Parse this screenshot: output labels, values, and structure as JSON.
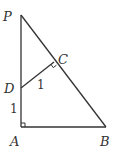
{
  "diagram": {
    "type": "geometry",
    "points": {
      "P": {
        "label": "P",
        "x": 21,
        "y": 15,
        "lx": 3,
        "ly": 21
      },
      "A": {
        "label": "A",
        "x": 21,
        "y": 127,
        "lx": 10,
        "ly": 146
      },
      "B": {
        "label": "B",
        "x": 106,
        "y": 127,
        "lx": 100,
        "ly": 146
      },
      "C": {
        "label": "C",
        "x": 54,
        "y": 62,
        "lx": 58,
        "ly": 64
      },
      "D": {
        "label": "D",
        "x": 21,
        "y": 88,
        "lx": 4,
        "ly": 93
      }
    },
    "segments": [
      {
        "from": "P",
        "to": "A"
      },
      {
        "from": "A",
        "to": "B"
      },
      {
        "from": "P",
        "to": "B"
      },
      {
        "from": "D",
        "to": "C"
      }
    ],
    "segment_labels": [
      {
        "segment": "DC",
        "text": "1",
        "x": 37,
        "y": 89
      },
      {
        "segment": "DA",
        "text": "1",
        "x": 10,
        "y": 113
      }
    ],
    "right_angles": [
      "A",
      "C"
    ],
    "stroke_color": "#333333"
  }
}
